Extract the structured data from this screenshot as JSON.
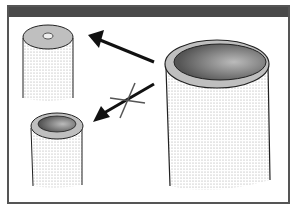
{
  "figure": {
    "elements": {
      "large_tube": {
        "label": "large hollow cylinder"
      },
      "solid_rod": {
        "label": "narrow rod with tiny lumen"
      },
      "small_tube": {
        "label": "small hollow cylinder"
      },
      "arrow_allowed": {
        "from": "large_tube",
        "to": "solid_rod"
      },
      "arrow_blocked": {
        "from": "large_tube",
        "to": "small_tube",
        "crossed_out": true
      }
    },
    "colors": {
      "header": "#4a4a4a",
      "border": "#555555",
      "rim": "#bdbdbd",
      "stipple": "#9a9a9a"
    }
  }
}
